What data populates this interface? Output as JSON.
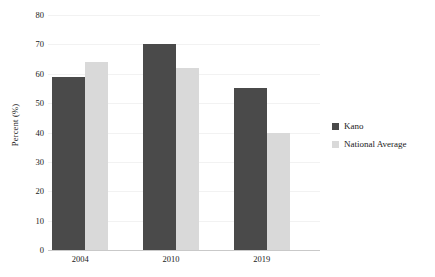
{
  "chart_data": {
    "type": "bar",
    "title": "",
    "subtitle": "",
    "xlabel": "",
    "ylabel": "Percent (%)",
    "categories": [
      "2004",
      "2010",
      "2019"
    ],
    "series": [
      {
        "name": "Kano",
        "color": "#4a4a4a",
        "values": [
          59,
          70,
          55
        ]
      },
      {
        "name": "National Average",
        "color": "#d9d9d9",
        "values": [
          64,
          62,
          40
        ]
      }
    ],
    "ylim": [
      0,
      80
    ],
    "ytick_step": 10,
    "yticks": [
      "0",
      "10",
      "20",
      "30",
      "40",
      "50",
      "60",
      "70",
      "80"
    ],
    "grid": true,
    "grid_color": "#f2f2f2",
    "axis_color": "#c9c9c9",
    "legend_position": "right",
    "background": "#ffffff"
  }
}
